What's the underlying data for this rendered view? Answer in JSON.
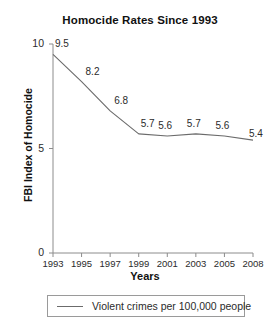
{
  "chart_data": {
    "type": "line",
    "title": "Homocide Rates Since 1993",
    "xlabel": "Years",
    "ylabel": "FBI Index of Homocide",
    "categories": [
      "1993",
      "1995",
      "1997",
      "1999",
      "2001",
      "2003",
      "2005",
      "2008"
    ],
    "values": [
      9.5,
      8.2,
      6.8,
      5.7,
      5.6,
      5.7,
      5.6,
      5.4
    ],
    "point_labels": [
      "9.5",
      "8.2",
      "6.8",
      "5.7",
      "5.6",
      "5.7",
      "5.6",
      "5.4"
    ],
    "ylim": [
      0,
      10
    ],
    "yticks": [
      0,
      5,
      10
    ],
    "ytick_labels": [
      "0",
      "5",
      "10"
    ],
    "grid": false,
    "legend_position": "bottom",
    "series": [
      {
        "name": "Violent crimes per 100,000 people",
        "values": [
          9.5,
          8.2,
          6.8,
          5.7,
          5.6,
          5.7,
          5.6,
          5.4
        ],
        "color": "#6b6b6b"
      }
    ],
    "colors": {
      "line": "#6b6b6b",
      "axis": "#8c8c8c",
      "text": "#2b2b2b",
      "background": "#ffffff"
    }
  },
  "legend": {
    "entries": [
      {
        "label": "Violent crimes per 100,000 people"
      }
    ]
  }
}
